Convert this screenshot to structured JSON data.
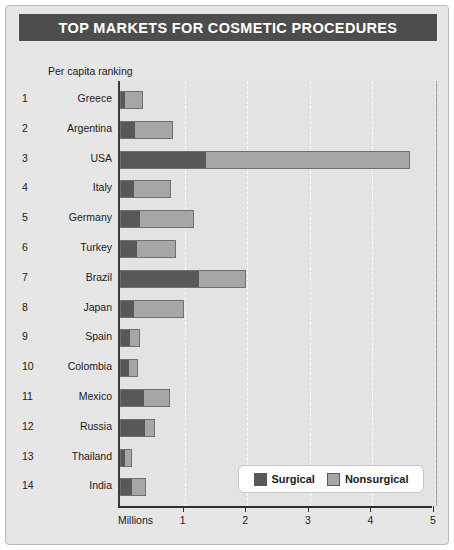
{
  "header": {
    "title": "TOP MARKETS FOR COSMETIC PROCEDURES"
  },
  "axis": {
    "unit_label": "Millions",
    "ticks": [
      "1",
      "2",
      "3",
      "4",
      "5"
    ]
  },
  "subtitle": "Per capita ranking",
  "legend": {
    "items": [
      {
        "label": "Surgical",
        "color": "#585858",
        "icon": "square-swatch-icon"
      },
      {
        "label": "Nonsurgical",
        "color": "#a6a6a6",
        "icon": "square-swatch-icon"
      }
    ]
  },
  "colors": {
    "title_bar": "#4d4d4d",
    "card_bg": "#e6e6e6",
    "plot_bg": "#e3e3e3",
    "surgical": "#585858",
    "nonsurgical": "#a6a6a6",
    "gridline": "#ffffff"
  },
  "chart_data": {
    "type": "bar",
    "orientation": "horizontal",
    "stacked": true,
    "title": "TOP MARKETS FOR COSMETIC PROCEDURES",
    "xlabel": "Millions",
    "ylabel": "Per capita ranking",
    "xlim": [
      0,
      5.05
    ],
    "xticks": [
      1,
      2,
      3,
      4,
      5
    ],
    "grid": true,
    "grid_axis": "x",
    "legend_position": "bottom-right",
    "categories": [
      "Greece",
      "Argentina",
      "USA",
      "Italy",
      "Germany",
      "Turkey",
      "Brazil",
      "Japan",
      "Spain",
      "Colombia",
      "Mexico",
      "Russia",
      "Thailand",
      "India"
    ],
    "ranks": [
      1,
      2,
      3,
      4,
      5,
      6,
      7,
      8,
      9,
      10,
      11,
      12,
      13,
      14
    ],
    "series": [
      {
        "name": "Surgical",
        "color": "#585858",
        "values": [
          0.06,
          0.22,
          1.35,
          0.21,
          0.3,
          0.25,
          1.25,
          0.2,
          0.14,
          0.12,
          0.37,
          0.38,
          0.06,
          0.18
        ]
      },
      {
        "name": "Nonsurgical",
        "color": "#a6a6a6",
        "values": [
          0.27,
          0.59,
          3.25,
          0.57,
          0.85,
          0.62,
          0.73,
          0.79,
          0.15,
          0.13,
          0.4,
          0.15,
          0.1,
          0.2
        ]
      }
    ],
    "totals": [
      0.33,
      0.81,
      4.6,
      0.78,
      1.15,
      0.87,
      1.98,
      0.99,
      0.29,
      0.25,
      0.77,
      0.53,
      0.16,
      0.38
    ]
  }
}
